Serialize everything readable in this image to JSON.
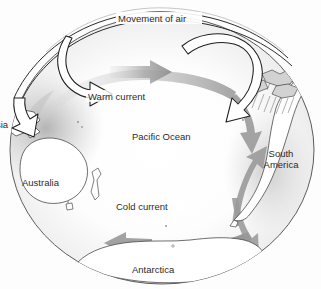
{
  "diagram": {
    "labels": {
      "movement_of_air": "Movement of air",
      "warm_current": "Warm current",
      "pacific_ocean": "Pacific Ocean",
      "cold_current": "Cold current",
      "antarctica": "Antarctica",
      "south_america_line1": "South",
      "south_america_line2": "America",
      "australia": "Australia",
      "asia_clipped": "sia"
    },
    "colors": {
      "outline": "#3a3a3a",
      "text": "#2b2b2b",
      "current_arrow": "#9a9a9a",
      "current_arrow_dark": "#8a8a8a",
      "air_arrow_fill": "#ffffff",
      "air_arrow_stroke": "#1f1f1f",
      "land_fill": "#ffffff",
      "shading": "#b9b9b9",
      "background": "#ffffff"
    },
    "elements": {
      "globe": "ocean-globe-outline",
      "air_loop_left": "ascending-air-arrow-over-asia",
      "air_loop_top": "upper-air-flow-westward",
      "air_loop_right": "descending-air-arrow-over-south-america",
      "current_warm": "warm-surface-current-flowing-west",
      "current_cold": "cold-current-flowing-east-along-antarctica",
      "upwelling": "cold-upwelling-off-south-america",
      "rain": "rainfall-over-south-america"
    }
  }
}
